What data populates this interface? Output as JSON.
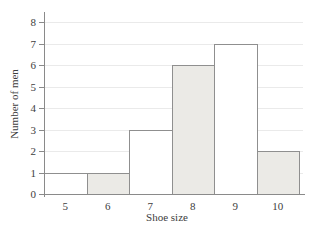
{
  "chart_data": {
    "type": "bar",
    "subtype": "histogram",
    "title": "",
    "xlabel": "Shoe size",
    "ylabel": "Number of men",
    "categories": [
      "5",
      "6",
      "7",
      "8",
      "9",
      "10"
    ],
    "values": [
      1,
      1,
      3,
      6,
      7,
      2
    ],
    "bins": [
      {
        "x0": 4.5,
        "x1": 5.5,
        "label": "5",
        "value": 1,
        "fill": "plain"
      },
      {
        "x0": 5.5,
        "x1": 6.5,
        "label": "6",
        "value": 1,
        "fill": "shaded"
      },
      {
        "x0": 6.5,
        "x1": 7.5,
        "label": "7",
        "value": 3,
        "fill": "plain"
      },
      {
        "x0": 7.5,
        "x1": 8.5,
        "label": "8",
        "value": 6,
        "fill": "shaded"
      },
      {
        "x0": 8.5,
        "x1": 9.5,
        "label": "9",
        "value": 7,
        "fill": "plain"
      },
      {
        "x0": 9.5,
        "x1": 10.5,
        "label": "10",
        "value": 2,
        "fill": "shaded"
      }
    ],
    "y_ticks": [
      0,
      1,
      2,
      3,
      4,
      5,
      6,
      7,
      8
    ],
    "xlim": [
      4.5,
      10.5
    ],
    "ylim": [
      0,
      8
    ],
    "grid": "horizontal",
    "legend": "none"
  },
  "colors": {
    "bar_fill_plain": "#ffffff",
    "bar_fill_shaded": "#ebeae6",
    "bar_border": "#8f8f8f",
    "axis": "#8a8a8a",
    "gridline": "#eaeaea",
    "text": "#3d3d3d",
    "background": "#ffffff"
  }
}
